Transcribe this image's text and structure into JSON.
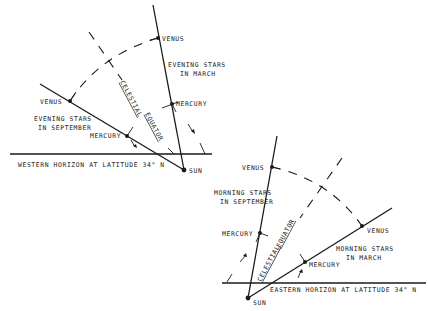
{
  "left_panel": {
    "horizon_label": "WESTERN HORIZON AT LATITUDE 34° N",
    "sun_label": "SUN",
    "equator_label_1": "CELESTIAL",
    "equator_label_2": "EQUATOR",
    "march": {
      "title_1": "EVENING STARS",
      "title_2": "IN MARCH",
      "venus": "VENUS",
      "mercury": "MERCURY"
    },
    "september": {
      "title_1": "EVENING STARS",
      "title_2": "IN SEPTEMBER",
      "venus": "VENUS",
      "mercury": "MERCURY"
    }
  },
  "right_panel": {
    "horizon_label": "EASTERN HORIZON AT LATITUDE 34° N",
    "sun_label": "SUN",
    "equator_label_1": "CELESTIAL",
    "equator_label_2": "EQUATOR",
    "september": {
      "title_1": "MORNING STARS",
      "title_2": "IN SEPTEMBER",
      "venus": "VENUS",
      "mercury": "MERCURY"
    },
    "march": {
      "title_1": "MORNING STARS",
      "title_2": "IN MARCH",
      "venus": "VENUS",
      "mercury": "MERCURY"
    }
  }
}
